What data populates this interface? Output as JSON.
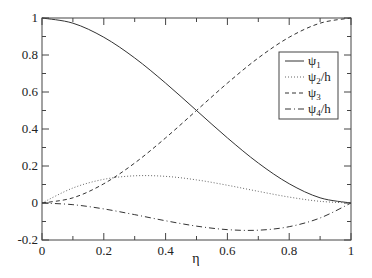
{
  "chart_data": {
    "type": "line",
    "title": "",
    "xlabel": "η",
    "ylabel": "",
    "xlim": [
      0,
      1
    ],
    "ylim": [
      -0.2,
      1
    ],
    "grid": false,
    "legend_position": "upper right (inside, below top)",
    "x_ticks": [
      "0",
      "0.2",
      "0.4",
      "0.6",
      "0.8",
      "1"
    ],
    "y_ticks": [
      "-0.2",
      "0",
      "0.2",
      "0.4",
      "0.6",
      "0.8",
      "1"
    ],
    "x": [
      0,
      0.1,
      0.2,
      0.3,
      0.4,
      0.5,
      0.6,
      0.7,
      0.8,
      0.9,
      1.0
    ],
    "series": [
      {
        "name": "ψ1",
        "label_main": "ψ",
        "label_sub": "1",
        "label_suffix": "",
        "style": "solid",
        "values": [
          1.0,
          0.972,
          0.896,
          0.784,
          0.648,
          0.5,
          0.352,
          0.216,
          0.104,
          0.028,
          0.0
        ]
      },
      {
        "name": "ψ2/h",
        "label_main": "ψ",
        "label_sub": "2",
        "label_suffix": "/h",
        "style": "dotted",
        "values": [
          0.0,
          0.081,
          0.128,
          0.147,
          0.144,
          0.125,
          0.096,
          0.063,
          0.032,
          0.009,
          0.0
        ]
      },
      {
        "name": "ψ3",
        "label_main": "ψ",
        "label_sub": "3",
        "label_suffix": "",
        "style": "dashed",
        "values": [
          0.0,
          0.028,
          0.104,
          0.216,
          0.352,
          0.5,
          0.648,
          0.784,
          0.896,
          0.972,
          1.0
        ]
      },
      {
        "name": "ψ4/h",
        "label_main": "ψ",
        "label_sub": "4",
        "label_suffix": "/h",
        "style": "dash-dot",
        "values": [
          0.0,
          -0.009,
          -0.032,
          -0.063,
          -0.096,
          -0.125,
          -0.144,
          -0.147,
          -0.128,
          -0.081,
          0.0
        ]
      }
    ]
  },
  "colors": {
    "axis": "#444444",
    "line": "#333333",
    "background": "#ffffff"
  }
}
